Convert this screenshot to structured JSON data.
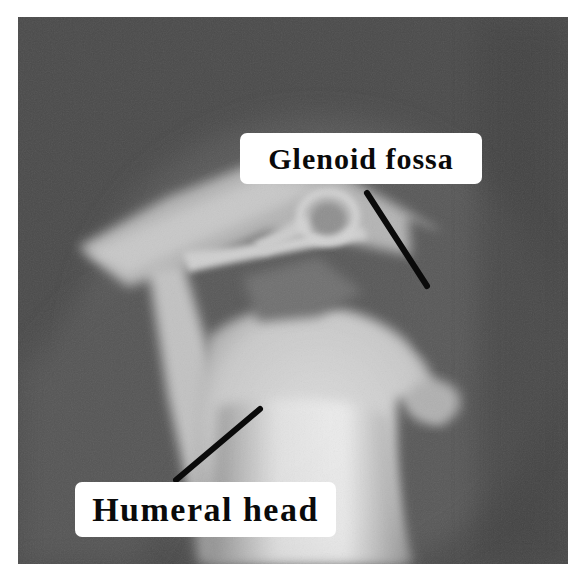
{
  "image": {
    "type": "shoulder-radiograph",
    "background_color": "#4b4b4b",
    "bone_color": "#e6e6e6"
  },
  "annotations": [
    {
      "id": "glenoid",
      "label": "Glenoid fossa",
      "leader_line": {
        "x1": 367,
        "y1": 193,
        "x2": 427,
        "y2": 286
      }
    },
    {
      "id": "humeral",
      "label": "Humeral head",
      "leader_line": {
        "x1": 260,
        "y1": 409,
        "x2": 176,
        "y2": 480
      }
    }
  ],
  "line_color": "#0a0a0a"
}
